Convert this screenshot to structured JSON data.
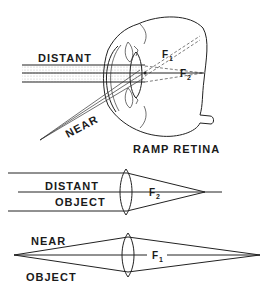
{
  "eye_diagram": {
    "label_distant": "DISTANT",
    "label_near": "NEAR",
    "label_f1": "F",
    "label_f1_sub": "1",
    "label_f2": "F",
    "label_f2_sub": "2",
    "caption": "RAMP RETINA"
  },
  "distant_lens_diagram": {
    "label_line1": "DISTANT",
    "label_line2": "OBJECT",
    "focal_label": "F",
    "focal_sub": "2"
  },
  "near_lens_diagram": {
    "label_line1": "NEAR",
    "label_line2": "OBJECT",
    "focal_label": "F",
    "focal_sub": "1"
  },
  "colors": {
    "ink": "#222222",
    "background": "#ffffff",
    "stipple": "#bdbdbd"
  }
}
